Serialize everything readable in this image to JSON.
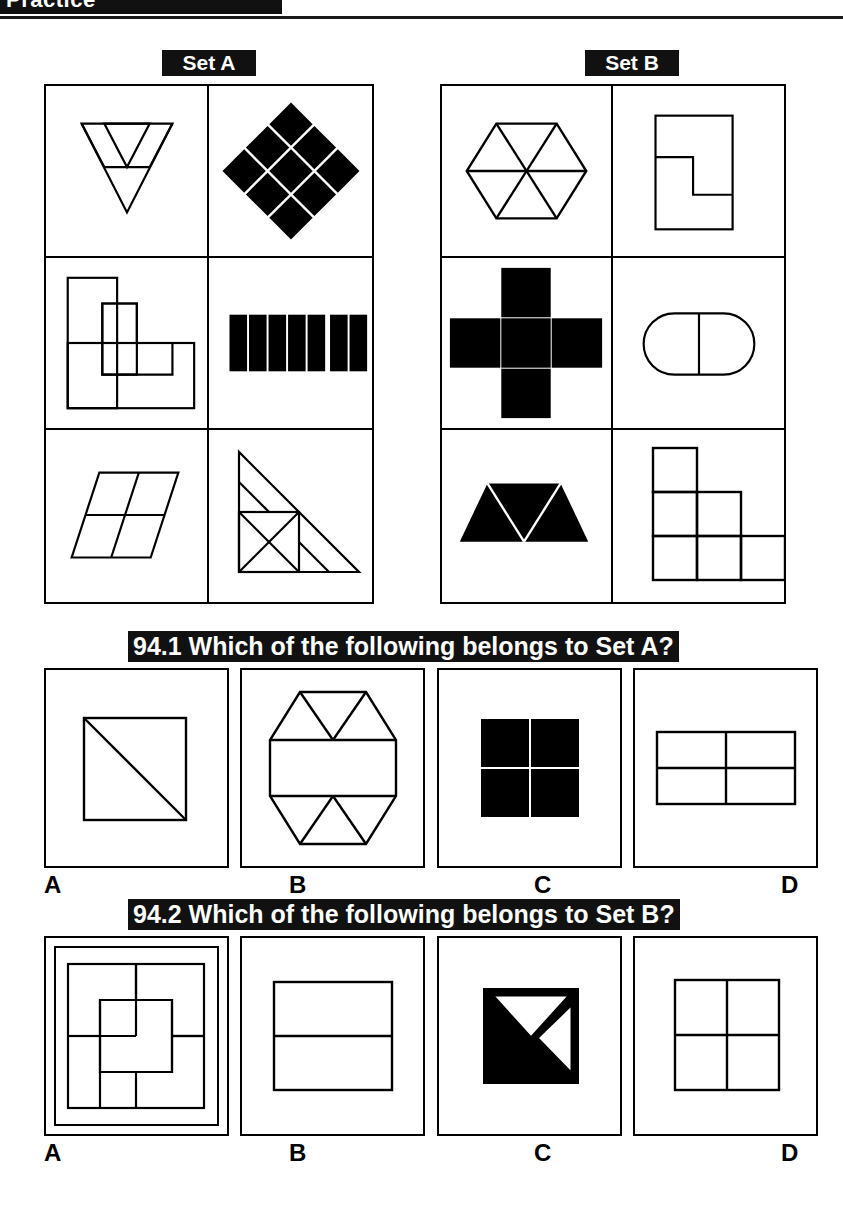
{
  "page": {
    "top_banner_text": "Practice",
    "background_color": "#ffffff",
    "ink_color": "#000000",
    "banner_color": "#111111"
  },
  "sets": {
    "a": {
      "label": "Set A",
      "cells": [
        {
          "name": "inverted-triangle-subdivided",
          "fill": "outline"
        },
        {
          "name": "diamond-of-nine-black-squares",
          "fill": "solid"
        },
        {
          "name": "overlapping-rectangles-l-shape",
          "fill": "outline"
        },
        {
          "name": "seven-black-vertical-bars",
          "fill": "solid"
        },
        {
          "name": "parallelogram-quartered",
          "fill": "outline"
        },
        {
          "name": "right-triangle-subdivided",
          "fill": "outline"
        }
      ]
    },
    "b": {
      "label": "Set B",
      "cells": [
        {
          "name": "hexagon-six-triangles",
          "fill": "outline"
        },
        {
          "name": "rectangle-with-z-step-line",
          "fill": "outline"
        },
        {
          "name": "black-cross-with-white-lines",
          "fill": "solid"
        },
        {
          "name": "stadium-split-vertically",
          "fill": "outline"
        },
        {
          "name": "black-trapezoid-three-triangles",
          "fill": "solid"
        },
        {
          "name": "staircase-of-five-squares",
          "fill": "outline"
        }
      ]
    }
  },
  "questions": [
    {
      "number": "94.1",
      "prompt": "94.1 Which of the following belongs to Set A?",
      "options": [
        {
          "letter": "A",
          "figure": "square-with-diagonal"
        },
        {
          "letter": "B",
          "figure": "hexagon-band-with-triangles"
        },
        {
          "letter": "C",
          "figure": "four-black-squares"
        },
        {
          "letter": "D",
          "figure": "rectangle-quartered"
        }
      ]
    },
    {
      "number": "94.2",
      "prompt": "94.2 Which of the following belongs to Set B?",
      "options": [
        {
          "letter": "A",
          "figure": "nested-square-pinwheel"
        },
        {
          "letter": "B",
          "figure": "rectangle-split-horizontally"
        },
        {
          "letter": "C",
          "figure": "black-square-with-white-triangles"
        },
        {
          "letter": "D",
          "figure": "square-quartered"
        }
      ]
    }
  ]
}
